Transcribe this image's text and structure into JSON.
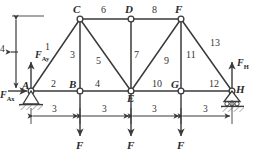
{
  "figure": {
    "kind": "truss-free-body-diagram",
    "stroke_color": "#3a3a3a",
    "label_color": "#2b2b2b"
  },
  "joints": [
    {
      "name": "A",
      "label": "A",
      "x": 31,
      "y": 91,
      "support": "pin"
    },
    {
      "name": "B",
      "label": "B",
      "x": 80,
      "y": 91,
      "support": "none"
    },
    {
      "name": "C",
      "label": "C",
      "x": 80,
      "y": 19,
      "support": "none"
    },
    {
      "name": "D",
      "label": "D",
      "x": 131,
      "y": 19,
      "support": "none"
    },
    {
      "name": "E",
      "label": "E",
      "x": 131,
      "y": 91,
      "support": "none"
    },
    {
      "name": "F",
      "label": "F",
      "x": 181,
      "y": 19,
      "support": "none"
    },
    {
      "name": "G",
      "label": "G",
      "x": 181,
      "y": 91,
      "support": "none"
    },
    {
      "name": "H",
      "label": "H",
      "x": 232,
      "y": 91,
      "support": "roller"
    }
  ],
  "members": [
    {
      "label": "1",
      "from": "A",
      "to": "C",
      "lx": 48,
      "ly": 47
    },
    {
      "label": "2",
      "from": "A",
      "to": "B",
      "lx": 52,
      "ly": 83
    },
    {
      "label": "3",
      "from": "C",
      "to": "B",
      "lx": 73,
      "ly": 54
    },
    {
      "label": "4",
      "from": "B",
      "to": "E",
      "lx": 96,
      "ly": 83
    },
    {
      "label": "5",
      "from": "C",
      "to": "E",
      "lx": 97,
      "ly": 60
    },
    {
      "label": "6",
      "from": "C",
      "to": "D",
      "lx": 102,
      "ly": 8
    },
    {
      "label": "7",
      "from": "D",
      "to": "E",
      "lx": 136,
      "ly": 54
    },
    {
      "label": "8",
      "from": "D",
      "to": "F",
      "lx": 153,
      "ly": 8
    },
    {
      "label": "9",
      "from": "E",
      "to": "F",
      "lx": 166,
      "ly": 60
    },
    {
      "label": "10",
      "from": "E",
      "to": "G",
      "lx": 155,
      "ly": 83
    },
    {
      "label": "11",
      "from": "F",
      "to": "G",
      "lx": 189,
      "ly": 54
    },
    {
      "label": "12",
      "from": "G",
      "to": "H",
      "lx": 212,
      "ly": 83
    },
    {
      "label": "13",
      "from": "F",
      "to": "H",
      "lx": 212,
      "ly": 44
    }
  ],
  "reactions": [
    {
      "name": "F_Ay",
      "base": "F",
      "sub": "Ay",
      "at_joint": "A",
      "direction": "up",
      "lx": 36,
      "ly": 55
    },
    {
      "name": "F_Ax",
      "base": "F",
      "sub": "Ax",
      "at_joint": "A",
      "direction": "right",
      "lx": 1,
      "ly": 93
    },
    {
      "name": "F_H",
      "base": "F",
      "sub": "H",
      "at_joint": "H",
      "direction": "up",
      "lx": 238,
      "ly": 63
    }
  ],
  "loads": [
    {
      "label": "F",
      "at_joint": "B",
      "direction": "down",
      "lx": 77,
      "ly": 142
    },
    {
      "label": "F",
      "at_joint": "E",
      "direction": "down",
      "lx": 128,
      "ly": 142
    },
    {
      "label": "F",
      "at_joint": "G",
      "direction": "down",
      "lx": 178,
      "ly": 142
    }
  ],
  "dimensions": {
    "horizontal": [
      {
        "label": "3",
        "from_x": 31,
        "to_x": 80,
        "y": 116,
        "lx": 53,
        "ly": 106
      },
      {
        "label": "3",
        "from_x": 80,
        "to_x": 131,
        "y": 116,
        "lx": 103,
        "ly": 106
      },
      {
        "label": "3",
        "from_x": 131,
        "to_x": 181,
        "y": 116,
        "lx": 153,
        "ly": 106
      },
      {
        "label": "3",
        "from_x": 181,
        "to_x": 232,
        "y": 116,
        "lx": 204,
        "ly": 106
      }
    ],
    "vertical": [
      {
        "label": "4",
        "x": 16,
        "from_y": 19,
        "to_y": 91,
        "lx": 1,
        "ly": 50
      }
    ]
  }
}
